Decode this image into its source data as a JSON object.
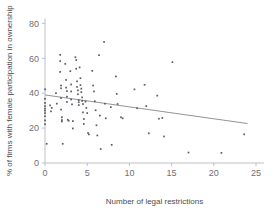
{
  "chart_data": {
    "type": "scatter",
    "title": "",
    "xlabel": "Number of legal restrictions",
    "ylabel": "% of firms with female participation in ownership",
    "xlim": [
      -0.8,
      25.8
    ],
    "ylim": [
      -3,
      84
    ],
    "xticks": [
      0,
      5,
      10,
      15,
      20,
      25
    ],
    "yticks": [
      0,
      20,
      40,
      60,
      80
    ],
    "xtick_labels": [
      "0",
      "5",
      "10",
      "15",
      "20",
      "25"
    ],
    "ytick_labels": [
      "0",
      "20",
      "40",
      "60",
      "80"
    ],
    "grid": false,
    "legend": null,
    "marker": "square",
    "marker_size": 1.7,
    "point_color": "#5b5b62",
    "axis_color": "#b9b9bd",
    "trendline": {
      "type": "line",
      "x": [
        0,
        24
      ],
      "y": [
        39.0,
        22.6
      ],
      "color": "#77777e"
    },
    "points": [
      [
        0.0,
        42.2
      ],
      [
        0.0,
        36.8
      ],
      [
        0.0,
        34.4
      ],
      [
        0.0,
        32.6
      ],
      [
        0.0,
        31.2
      ],
      [
        0.0,
        30.0
      ],
      [
        0.0,
        28.6
      ],
      [
        0.0,
        26.8
      ],
      [
        0.0,
        24.4
      ],
      [
        0.0,
        22.2
      ],
      [
        0.2,
        11.0
      ],
      [
        0.6,
        33.0
      ],
      [
        0.7,
        29.6
      ],
      [
        0.8,
        31.6
      ],
      [
        1.3,
        40.0
      ],
      [
        1.4,
        34.0
      ],
      [
        1.8,
        62.0
      ],
      [
        1.8,
        58.4
      ],
      [
        1.8,
        52.2
      ],
      [
        1.9,
        44.4
      ],
      [
        1.9,
        42.8
      ],
      [
        1.9,
        37.2
      ],
      [
        1.9,
        30.6
      ],
      [
        2.0,
        26.2
      ],
      [
        2.0,
        24.6
      ],
      [
        2.0,
        23.8
      ],
      [
        2.1,
        11.0
      ],
      [
        2.4,
        56.8
      ],
      [
        2.5,
        47.6
      ],
      [
        2.5,
        43.2
      ],
      [
        2.6,
        41.2
      ],
      [
        2.6,
        38.0
      ],
      [
        2.6,
        35.0
      ],
      [
        2.7,
        24.8
      ],
      [
        2.8,
        24.2
      ],
      [
        3.0,
        52.6
      ],
      [
        3.1,
        45.0
      ],
      [
        3.1,
        41.0
      ],
      [
        3.1,
        36.4
      ],
      [
        3.2,
        33.6
      ],
      [
        3.3,
        24.0
      ],
      [
        3.3,
        19.8
      ],
      [
        3.6,
        60.6
      ],
      [
        3.7,
        59.0
      ],
      [
        3.7,
        54.0
      ],
      [
        3.8,
        46.8
      ],
      [
        3.8,
        43.6
      ],
      [
        3.9,
        41.6
      ],
      [
        3.9,
        39.4
      ],
      [
        4.0,
        36.0
      ],
      [
        4.0,
        34.8
      ],
      [
        4.0,
        33.2
      ],
      [
        4.1,
        54.8
      ],
      [
        4.2,
        48.6
      ],
      [
        4.2,
        44.6
      ],
      [
        4.3,
        42.6
      ],
      [
        4.3,
        40.6
      ],
      [
        4.4,
        37.6
      ],
      [
        4.4,
        35.6
      ],
      [
        4.5,
        33.8
      ],
      [
        4.5,
        29.0
      ],
      [
        4.6,
        25.2
      ],
      [
        4.6,
        22.4
      ],
      [
        4.8,
        35.2
      ],
      [
        4.9,
        31.6
      ],
      [
        5.0,
        28.6
      ],
      [
        5.1,
        17.2
      ],
      [
        5.2,
        16.4
      ],
      [
        5.6,
        52.8
      ],
      [
        5.7,
        44.4
      ],
      [
        5.8,
        41.0
      ],
      [
        5.9,
        35.4
      ],
      [
        6.0,
        30.2
      ],
      [
        6.1,
        21.6
      ],
      [
        6.2,
        15.8
      ],
      [
        6.4,
        61.8
      ],
      [
        6.5,
        27.2
      ],
      [
        6.6,
        8.0
      ],
      [
        7.0,
        69.4
      ],
      [
        7.1,
        34.0
      ],
      [
        7.2,
        25.6
      ],
      [
        7.8,
        32.0
      ],
      [
        7.9,
        10.4
      ],
      [
        8.4,
        49.6
      ],
      [
        8.5,
        39.6
      ],
      [
        8.6,
        33.8
      ],
      [
        9.0,
        26.2
      ],
      [
        9.2,
        25.6
      ],
      [
        10.6,
        42.2
      ],
      [
        10.9,
        31.4
      ],
      [
        11.8,
        44.8
      ],
      [
        12.0,
        32.6
      ],
      [
        12.3,
        17.0
      ],
      [
        13.3,
        38.6
      ],
      [
        13.5,
        25.4
      ],
      [
        13.9,
        25.8
      ],
      [
        14.1,
        15.2
      ],
      [
        15.1,
        57.8
      ],
      [
        17.0,
        6.0
      ],
      [
        20.9,
        5.8
      ],
      [
        23.6,
        16.4
      ]
    ]
  }
}
